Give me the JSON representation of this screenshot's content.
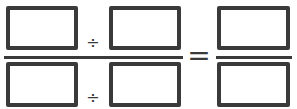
{
  "expression": {
    "numerator": {
      "left_box": "",
      "operator": "÷",
      "right_box": ""
    },
    "denominator": {
      "left_box": "",
      "operator": "÷",
      "right_box": ""
    },
    "equals": "=",
    "result": {
      "numerator_box": "",
      "denominator_box": ""
    }
  },
  "colors": {
    "stroke": "#3a3a3a",
    "background": "#ffffff"
  }
}
